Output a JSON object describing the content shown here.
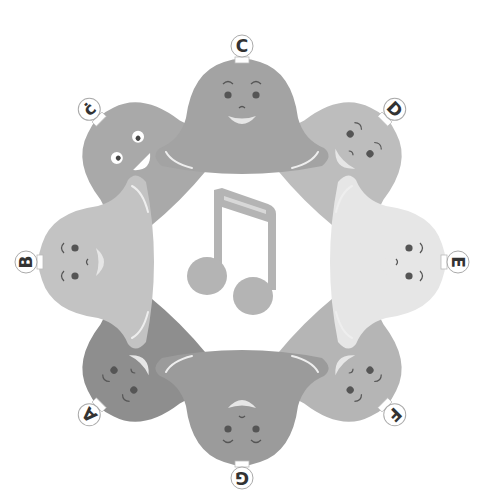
{
  "illustration": {
    "title": "Singing bells around a music note",
    "center": {
      "x": 242,
      "y": 262
    },
    "note": {
      "symbol": "beamed-eighth-notes",
      "color": "#b4b4b4"
    },
    "bells": [
      {
        "label": "C",
        "angle": 0,
        "color": "#a3a3a3",
        "expression": "smile-open"
      },
      {
        "label": "D",
        "angle": 45,
        "color": "#bdbdbd",
        "expression": "smile"
      },
      {
        "label": "E",
        "angle": 90,
        "color": "#e6e6e6",
        "expression": "smile"
      },
      {
        "label": "F",
        "angle": 135,
        "color": "#b5b5b5",
        "expression": "smile"
      },
      {
        "label": "G",
        "angle": 180,
        "color": "#9b9b9b",
        "expression": "smile"
      },
      {
        "label": "A",
        "angle": 225,
        "color": "#8e8e8e",
        "expression": "smile"
      },
      {
        "label": "B",
        "angle": 270,
        "color": "#c3c3c3",
        "expression": "smile"
      },
      {
        "label": "ċ",
        "angle": 315,
        "color": "#a9a9a9",
        "expression": "wide-eyed-grin"
      }
    ]
  }
}
